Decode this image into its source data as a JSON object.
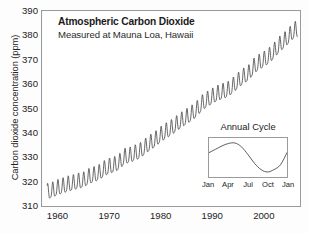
{
  "chart_data": {
    "type": "line",
    "title": "Atmospheric Carbon Dioxide",
    "subtitle": "Measured at Mauna Loa, Hawaii",
    "xlabel": "",
    "ylabel": "Carbon dioxide concentration (ppm)",
    "xlim": [
      1957,
      2007
    ],
    "ylim": [
      310,
      390
    ],
    "grid": false,
    "legend": null,
    "yticks": [
      310,
      320,
      330,
      340,
      350,
      360,
      370,
      380,
      390
    ],
    "xticks": [
      1960,
      1970,
      1980,
      1990,
      2000
    ],
    "series": [
      {
        "name": "Monthly mean CO2 (ppm)",
        "description": "Keeling Curve: rising trend with annual sawtooth oscillation of about 6 ppm peak-to-trough",
        "x": [
          1958,
          1959,
          1960,
          1961,
          1962,
          1963,
          1964,
          1965,
          1966,
          1967,
          1968,
          1969,
          1970,
          1971,
          1972,
          1973,
          1974,
          1975,
          1976,
          1977,
          1978,
          1979,
          1980,
          1981,
          1982,
          1983,
          1984,
          1985,
          1986,
          1987,
          1988,
          1989,
          1990,
          1991,
          1992,
          1993,
          1994,
          1995,
          1996,
          1997,
          1998,
          1999,
          2000,
          2001,
          2002,
          2003,
          2004,
          2005,
          2006
        ],
        "values": [
          315.3,
          315.9,
          316.9,
          317.6,
          318.4,
          318.9,
          319.6,
          320.0,
          321.4,
          322.2,
          323.0,
          324.6,
          325.7,
          326.3,
          327.5,
          329.7,
          330.2,
          331.1,
          332.0,
          333.8,
          335.4,
          336.8,
          338.7,
          340.1,
          341.4,
          343.0,
          344.6,
          346.0,
          347.4,
          349.2,
          351.6,
          353.1,
          354.4,
          355.6,
          356.4,
          357.1,
          358.8,
          360.8,
          362.6,
          363.8,
          366.6,
          368.3,
          369.5,
          371.0,
          373.1,
          375.6,
          377.4,
          379.6,
          381.8
        ]
      }
    ],
    "annotations": [
      {
        "name": "start-value",
        "text": "about 315 ppm in 1958"
      },
      {
        "name": "end-value",
        "text": "about 382 ppm in 2006"
      }
    ]
  },
  "inset_chart": {
    "type": "line",
    "title": "Annual Cycle",
    "xticks": [
      "Jan",
      "Apr",
      "Jul",
      "Oct",
      "Jan"
    ],
    "description": "Seasonal CO2 oscillation: rises from January to a May peak, falls to an October minimum, then rises again",
    "x": [
      "Jan",
      "Feb",
      "Mar",
      "Apr",
      "May",
      "Jun",
      "Jul",
      "Aug",
      "Sep",
      "Oct",
      "Nov",
      "Dec",
      "Jan"
    ],
    "values": [
      1.0,
      1.7,
      2.4,
      2.9,
      3.0,
      2.2,
      0.6,
      -1.2,
      -2.5,
      -3.0,
      -2.5,
      -1.5,
      1.0
    ]
  },
  "colors": {
    "line": "#4a4a4a",
    "frame": "#9a9a9a",
    "text": "#222222",
    "background": "#ffffff"
  }
}
